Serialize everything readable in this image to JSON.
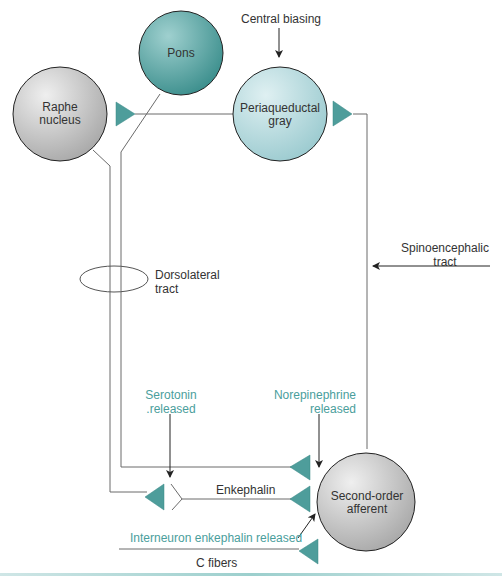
{
  "diagram": {
    "colors": {
      "teal_dark": "#3f9593",
      "teal_light": "#a8d3d6",
      "gray_node": "#c4c4c4",
      "line": "#6b6b6b",
      "label_teal": "#4a9e9c"
    },
    "nodes": {
      "pons": "Pons",
      "raphe_line1": "Raphe",
      "raphe_line2": "nucleus",
      "pag_line1": "Periaqueductal",
      "pag_line2": "gray",
      "second_order_line1": "Second-order",
      "second_order_line2": "afferent"
    },
    "labels": {
      "central_biasing": "Central biasing",
      "dorsolateral_line1": "Dorsolateral",
      "dorsolateral_line2": "tract",
      "spinoencephalic_line1": "Spinoencephalic",
      "spinoencephalic_line2": "tract",
      "serotonin_line1": "Serotonin",
      "serotonin_line2": ".released",
      "norepinephrine_line1": "Norepinephrine",
      "norepinephrine_line2": "released",
      "enkephalin": "Enkephalin",
      "interneuron": "Interneuron enkephalin released",
      "c_fibers": "C fibers"
    }
  }
}
